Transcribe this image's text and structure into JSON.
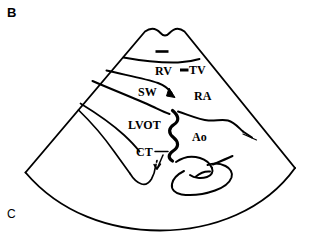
{
  "figure": {
    "type": "line-drawing",
    "background_color": "#ffffff",
    "line_color": "#000000",
    "width": 310,
    "height": 237
  },
  "panels": {
    "top_label": "B",
    "bottom_label": "C"
  },
  "anatomical_labels": [
    {
      "key": "rv",
      "text": "RV",
      "meaning": "right ventricle"
    },
    {
      "key": "tv",
      "text": "TV",
      "meaning": "tricuspid valve"
    },
    {
      "key": "sw",
      "text": "SW",
      "meaning": "septal wall"
    },
    {
      "key": "ra",
      "text": "RA",
      "meaning": "right atrium"
    },
    {
      "key": "lvot",
      "text": "LVOT",
      "meaning": "left ventricular outflow tract"
    },
    {
      "key": "ao",
      "text": "Ao",
      "meaning": "aorta"
    },
    {
      "key": "ct",
      "text": "CT",
      "meaning": "chordae tendineae"
    }
  ],
  "markers": {
    "apex_dash": "short-dash-marker",
    "tv_pointer": "dash-pointer-marker",
    "sw_arrowhead": "filled-arrowhead-marker",
    "ct_leader": "leader-line-with-arrow"
  },
  "colors": {
    "ink": "#000000",
    "paper": "#ffffff"
  }
}
